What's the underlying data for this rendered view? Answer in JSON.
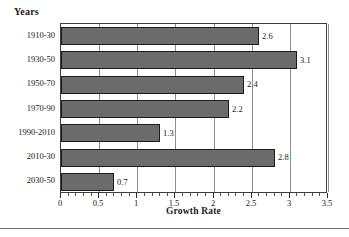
{
  "chart_data": {
    "type": "bar",
    "orientation": "horizontal",
    "title": "",
    "xlabel": "Growth Rate",
    "ylabel": "Years",
    "categories": [
      "1910-30",
      "1930-50",
      "1950-70",
      "1970-90",
      "1990-2010",
      "2010-30",
      "2030-50"
    ],
    "values": [
      2.6,
      3.1,
      2.4,
      2.2,
      1.3,
      2.8,
      0.7
    ],
    "value_labels": [
      "2.6",
      "3.1",
      "2.4",
      "2.2",
      "1.3",
      "2.8",
      "0.7"
    ],
    "xlim": [
      0,
      3.5
    ],
    "xticks": [
      0,
      0.5,
      1,
      1.5,
      2,
      2.5,
      3,
      3.5
    ],
    "xtick_labels": [
      "0",
      "0.5",
      "1",
      "1.5",
      "2",
      "2.5",
      "3",
      "3.5"
    ],
    "minor_ticks_per_interval": 4,
    "grid": "vertical-major",
    "legend": "none",
    "bar_color": "#6b6b6b",
    "bar_edge_color": "#1c1c1c",
    "grid_color": "#8c8c8c",
    "axis_color": "#3d3d3d"
  }
}
